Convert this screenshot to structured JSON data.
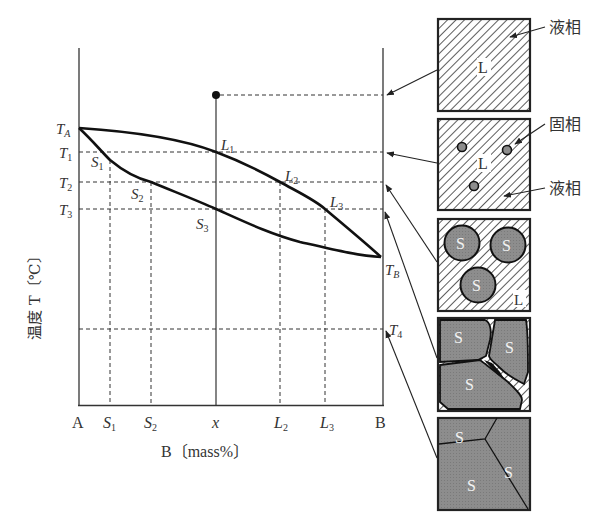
{
  "diagram": {
    "type": "binary phase diagram (complete solid solubility) with solidification microstructures",
    "y_axis_label": "温度 T〔℃〕",
    "x_axis_label": "B〔mass%〕",
    "x_ticks": [
      "A",
      "S1",
      "S2",
      "x",
      "L2",
      "L3",
      "B"
    ],
    "temperature_labels": {
      "TA": "T",
      "TA_sub": "A",
      "T1": "T",
      "T1_sub": "1",
      "T2": "T",
      "T2_sub": "2",
      "T3": "T",
      "T3_sub": "3",
      "TB": "T",
      "TB_sub": "B",
      "T4": "T",
      "T4_sub": "4"
    },
    "points": {
      "S1": "S",
      "S1_sub": "1",
      "S2": "S",
      "S2_sub": "2",
      "S3": "S",
      "S3_sub": "3",
      "L1": "L",
      "L1_sub": "1",
      "L2": "L",
      "L2_sub": "2",
      "L3": "L",
      "L3_sub": "3"
    },
    "ticks": {
      "A": "A",
      "S1": "S",
      "S1_sub": "1",
      "S2": "S",
      "S2_sub": "2",
      "x": "x",
      "L2": "L",
      "L2_sub": "2",
      "L3": "L",
      "L3_sub": "3",
      "B": "B"
    },
    "curves": [
      "liquidus (upper, T_A → L1 → L2 → L3 → T_B)",
      "solidus (lower, T_A → S1 → S2 → S3 → T_B)"
    ]
  },
  "microstructures": [
    {
      "stage": "above liquidus",
      "phase_label": "L",
      "callouts": [
        "液相"
      ]
    },
    {
      "stage": "T1",
      "phase_label": "L",
      "callouts": [
        "固相",
        "液相"
      ]
    },
    {
      "stage": "T2",
      "phase_labels": [
        "S",
        "S",
        "S",
        "L"
      ]
    },
    {
      "stage": "T3",
      "phase_labels": [
        "S",
        "S",
        "S"
      ]
    },
    {
      "stage": "T4",
      "phase_labels": [
        "S",
        "S",
        "S"
      ]
    }
  ],
  "callouts": {
    "liquid_1": "液相",
    "solid": "固相",
    "liquid_2": "液相"
  },
  "box_labels": {
    "b1_L": "L",
    "b2_L": "L",
    "b3_S1": "S",
    "b3_S2": "S",
    "b3_S3": "S",
    "b3_L": "L",
    "b4_S1": "S",
    "b4_S2": "S",
    "b4_S3": "S",
    "b5_S1": "S",
    "b5_S2": "S",
    "b5_S3": "S"
  },
  "colors": {
    "line": "#222222",
    "grain_fill": "#8c8c8c",
    "hatch": "#333333",
    "background": "#ffffff"
  }
}
